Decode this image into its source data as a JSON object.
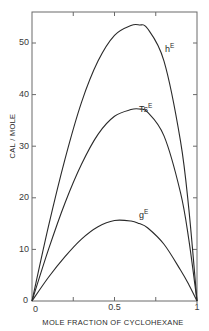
{
  "chart_data": {
    "type": "line",
    "title": "",
    "xlabel": "MOLE FRACTION OF CYCLOHEXANE",
    "ylabel": "CAL / MOLE",
    "xlim": [
      0,
      1
    ],
    "ylim": [
      0,
      56
    ],
    "x_ticks": [
      0,
      0.25,
      0.5,
      0.75,
      1
    ],
    "x_tick_labels": [
      "0",
      "",
      "0.5",
      "",
      "1"
    ],
    "y_ticks": [
      0,
      10,
      20,
      30,
      40,
      50
    ],
    "y_tick_labels": [
      "0",
      "10",
      "20",
      "30",
      "40",
      "50"
    ],
    "grid": false,
    "legend": "inline curve labels",
    "x": [
      0,
      0.1,
      0.2,
      0.3,
      0.4,
      0.5,
      0.6,
      0.65,
      0.7,
      0.8,
      0.9,
      0.95,
      1.0
    ],
    "series": [
      {
        "name": "hE",
        "label_main": "h",
        "label_sup": "E",
        "values": [
          0,
          14.5,
          27.5,
          38.5,
          46.5,
          51.5,
          53.4,
          53.5,
          52.8,
          46.5,
          31.0,
          18.0,
          0
        ]
      },
      {
        "name": "TsE",
        "label_main": "Ts",
        "label_sup": "E",
        "values": [
          0,
          10.0,
          19.0,
          26.5,
          32.3,
          35.8,
          37.1,
          37.2,
          36.6,
          32.0,
          21.0,
          12.0,
          0
        ]
      },
      {
        "name": "gE",
        "label_main": "g",
        "label_sup": "E",
        "values": [
          0,
          4.6,
          8.6,
          12.0,
          14.4,
          15.6,
          15.5,
          15.0,
          14.2,
          11.0,
          6.0,
          3.2,
          0
        ]
      }
    ],
    "origin_labels": [
      "0",
      "0"
    ]
  },
  "colors": {
    "background": "#ffffff",
    "axis": "#6a6a6a",
    "curve": "#2a2a2a",
    "text": "#3a3a3a"
  }
}
